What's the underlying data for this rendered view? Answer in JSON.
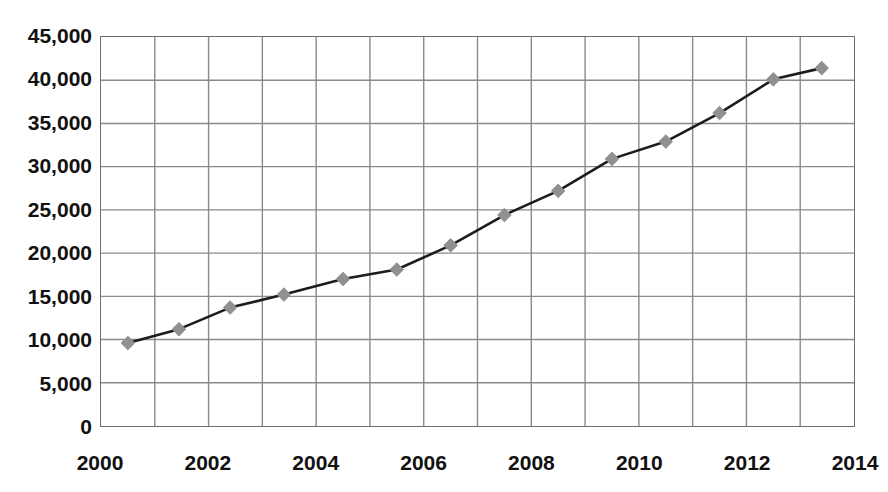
{
  "chart_title_visible_fragment": "",
  "chart_data": {
    "type": "line",
    "title": "",
    "xlabel": "",
    "ylabel": "",
    "xlim": [
      2000,
      2014
    ],
    "ylim": [
      0,
      45000
    ],
    "grid": true,
    "legend": "none",
    "x_ticks": [
      "2000",
      "2002",
      "2004",
      "2006",
      "2008",
      "2010",
      "2012",
      "2014"
    ],
    "x_tick_values": [
      2000,
      2002,
      2004,
      2006,
      2008,
      2010,
      2012,
      2014
    ],
    "x_gridline_values": [
      2000,
      2001,
      2002,
      2003,
      2004,
      2005,
      2006,
      2007,
      2008,
      2009,
      2010,
      2011,
      2012,
      2013,
      2014
    ],
    "y_ticks": [
      "0",
      "5,000",
      "10,000",
      "15,000",
      "20,000",
      "25,000",
      "30,000",
      "35,000",
      "40,000",
      "45,000"
    ],
    "y_tick_values": [
      0,
      5000,
      10000,
      15000,
      20000,
      25000,
      30000,
      35000,
      40000,
      45000
    ],
    "series": [
      {
        "name": "series-1",
        "marker": "diamond",
        "marker_color": "#909090",
        "line_color": "#1c1c1c",
        "x": [
          2000.5,
          2001.45,
          2002.4,
          2003.4,
          2004.5,
          2005.5,
          2006.5,
          2007.5,
          2008.5,
          2009.5,
          2010.5,
          2011.5,
          2012.5,
          2013.4
        ],
        "values": [
          9600,
          11200,
          13700,
          15200,
          17000,
          18100,
          20900,
          24400,
          27200,
          30900,
          32900,
          36200,
          40100,
          41400
        ]
      }
    ]
  },
  "style": {
    "background": "#ffffff",
    "grid_color": "#8a8a8a",
    "frame_color": "#6e6e6e",
    "text_color": "#111111"
  }
}
